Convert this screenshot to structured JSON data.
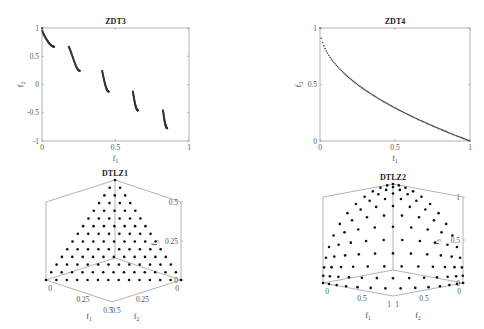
{
  "chart_data": [
    {
      "id": "zdt3",
      "type": "scatter",
      "title": "ZDT3",
      "xlabel": "f1",
      "ylabel": "f2",
      "xlim": [
        0,
        1
      ],
      "ylim": [
        -1,
        1
      ],
      "xticks": [
        "0",
        "0.5",
        "1"
      ],
      "yticks": [
        "-1",
        "-0.5",
        "0",
        "0.5",
        "1"
      ],
      "grid": false,
      "series": [
        {
          "name": "Pareto front segment 1",
          "f1_range": [
            0.0,
            0.083
          ],
          "f2_range": [
            1.0,
            0.67
          ]
        },
        {
          "name": "Pareto front segment 2",
          "f1_range": [
            0.182,
            0.258
          ],
          "f2_range": [
            0.64,
            0.24
          ]
        },
        {
          "name": "Pareto front segment 3",
          "f1_range": [
            0.409,
            0.454
          ],
          "f2_range": [
            0.23,
            -0.15
          ]
        },
        {
          "name": "Pareto front segment 4",
          "f1_range": [
            0.618,
            0.653
          ],
          "f2_range": [
            -0.17,
            -0.46
          ]
        },
        {
          "name": "Pareto front segment 5",
          "f1_range": [
            0.823,
            0.852
          ],
          "f2_range": [
            -0.48,
            -0.77
          ]
        }
      ]
    },
    {
      "id": "zdt4",
      "type": "scatter",
      "title": "ZDT4",
      "xlabel": "f1",
      "ylabel": "f2",
      "xlim": [
        0,
        1
      ],
      "ylim": [
        0,
        1
      ],
      "xticks": [
        "0",
        "0.5",
        "1"
      ],
      "yticks": [
        "0",
        "0.5",
        "1"
      ],
      "grid": false,
      "series": [
        {
          "name": "Pareto front",
          "formula": "f2 = 1 - sqrt(f1)",
          "x": [
            0,
            0.05,
            0.1,
            0.2,
            0.3,
            0.4,
            0.5,
            0.6,
            0.7,
            0.8,
            0.9,
            1.0
          ],
          "y": [
            1.0,
            0.776,
            0.684,
            0.553,
            0.452,
            0.368,
            0.293,
            0.225,
            0.163,
            0.106,
            0.051,
            0.0
          ]
        }
      ]
    },
    {
      "id": "dtlz1",
      "type": "scatter",
      "title": "DTLZ1",
      "xlabel": "f1",
      "ylabel": "f2",
      "zlabel": "f3",
      "xlim": [
        0,
        0.5
      ],
      "ylim": [
        0,
        0.5
      ],
      "zlim": [
        0,
        0.5
      ],
      "xticks": [
        "0",
        "0.25",
        "0.5"
      ],
      "yticks": [
        "0",
        "0.25",
        "0.5"
      ],
      "zticks": [
        "0",
        "0.25",
        "0.5"
      ],
      "grid": false,
      "series": [
        {
          "name": "Pareto front",
          "surface": "f1 + f2 + f3 = 0.5",
          "divisions": 13,
          "points": 105
        }
      ]
    },
    {
      "id": "dtlz2",
      "type": "scatter",
      "title": "DTLZ2",
      "xlabel": "f1",
      "ylabel": "f2",
      "zlabel": "f3",
      "xlim": [
        0,
        1
      ],
      "ylim": [
        0,
        1
      ],
      "zlim": [
        0,
        1
      ],
      "xticks": [
        "0",
        "0.5",
        "1"
      ],
      "yticks": [
        "0",
        "0.5",
        "1"
      ],
      "zticks": [
        "0",
        "0.5",
        "1"
      ],
      "grid": false,
      "series": [
        {
          "name": "Pareto front",
          "surface": "f1^2 + f2^2 + f3^2 = 1",
          "divisions": 13,
          "points": 105
        }
      ]
    }
  ]
}
